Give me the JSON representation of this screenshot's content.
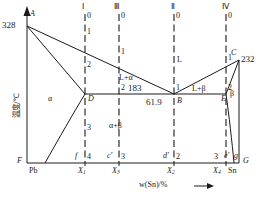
{
  "figure": {
    "kind": "binary-eutectic-phase-diagram",
    "system": "Pb-Sn",
    "y_axis_label": "温度/℃",
    "x_axis_label": "w(Sn)/%"
  },
  "axes": {
    "y_ticks": [
      {
        "id": "t328",
        "label": "328",
        "value": 328
      },
      {
        "id": "t183",
        "label": "183",
        "value": 183
      },
      {
        "id": "t232",
        "label": "232",
        "value": 232
      }
    ],
    "x_ticks": [
      {
        "id": "xPb",
        "label": "Pb"
      },
      {
        "id": "x1",
        "label": "X",
        "sub": "1"
      },
      {
        "id": "x3",
        "label": "X",
        "sub": "3"
      },
      {
        "id": "x2",
        "label": "X",
        "sub": "2"
      },
      {
        "id": "x4",
        "label": "X",
        "sub": "4"
      },
      {
        "id": "xSn",
        "label": "Sn"
      }
    ],
    "eutectic_composition": "61.9"
  },
  "points": [
    {
      "id": "A",
      "label": "A"
    },
    {
      "id": "B",
      "label": "B"
    },
    {
      "id": "C",
      "label": "C"
    },
    {
      "id": "D",
      "label": "D"
    },
    {
      "id": "E",
      "label": "E"
    },
    {
      "id": "F",
      "label": "F"
    },
    {
      "id": "G",
      "label": "G"
    },
    {
      "id": "f",
      "label": "f"
    },
    {
      "id": "g",
      "label": "g"
    },
    {
      "id": "cprime",
      "label": "c'"
    },
    {
      "id": "dprime",
      "label": "d'"
    },
    {
      "id": "eprime",
      "label": "e'"
    }
  ],
  "regions": [
    {
      "id": "L",
      "label": "L"
    },
    {
      "id": "alpha",
      "label": "α"
    },
    {
      "id": "beta",
      "label": "β"
    },
    {
      "id": "L_alpha",
      "label": "L+α"
    },
    {
      "id": "L_beta",
      "label": "L+β"
    },
    {
      "id": "alpha_beta",
      "label": "α+β"
    }
  ],
  "cooling_curves": [
    {
      "id": "I",
      "roman": "Ⅰ",
      "stages": [
        "0",
        "1",
        "2",
        "3",
        "4"
      ]
    },
    {
      "id": "III",
      "roman": "Ⅲ",
      "stages": [
        "0",
        "1",
        "2",
        "3"
      ]
    },
    {
      "id": "II",
      "roman": "Ⅱ",
      "stages": [
        "0",
        "1",
        "2"
      ]
    },
    {
      "id": "IV",
      "roman": "Ⅳ",
      "stages": [
        "0",
        "1",
        "2",
        "3"
      ]
    }
  ],
  "colors": {
    "line": "#1a1a1a",
    "background": "#ffffff",
    "text": "#1a1a1a"
  }
}
